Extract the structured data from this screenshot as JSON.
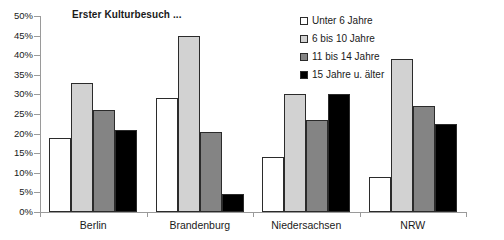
{
  "chart_data": {
    "type": "bar",
    "title": "Erster Kulturbesuch ...",
    "xlabel": "",
    "ylabel": "",
    "ylim": [
      0,
      50
    ],
    "ytick_step": 5,
    "ytick_labels": [
      "50%",
      "45%",
      "40%",
      "35%",
      "30%",
      "25%",
      "20%",
      "15%",
      "10%",
      "5%",
      "0%"
    ],
    "ytick_values": [
      50,
      45,
      40,
      35,
      30,
      25,
      20,
      15,
      10,
      5,
      0
    ],
    "grid": false,
    "legend_position": "top-right",
    "categories": [
      "Berlin",
      "Brandenburg",
      "Niedersachsen",
      "NRW"
    ],
    "series": [
      {
        "name": "Unter 6 Jahre",
        "color": "#ffffff",
        "values": [
          19,
          29,
          14,
          9
        ]
      },
      {
        "name": "6 bis 10 Jahre",
        "color": "#d2d2d2",
        "values": [
          33,
          45,
          30,
          39
        ]
      },
      {
        "name": "11 bis 14 Jahre",
        "color": "#848484",
        "values": [
          26,
          20.5,
          23.5,
          27
        ]
      },
      {
        "name": "15 Jahre u. älter",
        "color": "#000000",
        "values": [
          21,
          4.5,
          30,
          22.5
        ]
      }
    ]
  },
  "axes": {
    "bar_border_color": "#2b2b2b",
    "axis_color": "#9a9a9a"
  }
}
